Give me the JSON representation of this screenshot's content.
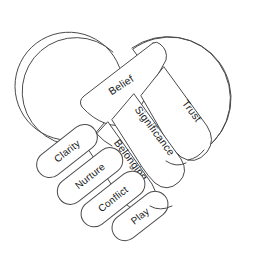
{
  "diagram": {
    "type": "concept-diagram",
    "background_color": "#ffffff",
    "stroke_color": "#4a4a4a",
    "text_color": "#1b1b1b",
    "fill_color": "#ffffff",
    "hands": [
      {
        "name": "left-hand-palm",
        "shape": "circle",
        "cx": 68,
        "cy": 82,
        "r": 54
      },
      {
        "name": "right-hand-palm",
        "shape": "circle",
        "cx": 177,
        "cy": 80,
        "r": 56
      }
    ],
    "fingers": [
      {
        "id": "belief",
        "label": "Belief",
        "rotation": -32,
        "x": 120,
        "y": 84,
        "group": "upper-finger"
      },
      {
        "id": "trust",
        "label": "Trust",
        "rotation": 52,
        "x": 192,
        "y": 108,
        "group": "upper-finger"
      },
      {
        "id": "significance",
        "label": "Significance",
        "rotation": 52,
        "x": 160,
        "y": 128,
        "group": "upper-finger"
      },
      {
        "id": "belonging",
        "label": "Belonging",
        "rotation": 52,
        "x": 137,
        "y": 156,
        "group": "upper-finger"
      }
    ],
    "capsules": [
      {
        "id": "clarity",
        "label": "Clarity",
        "rotation": -38,
        "x": 67,
        "y": 151,
        "group": "lower-finger"
      },
      {
        "id": "nurture",
        "label": "Nurture",
        "rotation": -38,
        "x": 90,
        "y": 176,
        "group": "lower-finger"
      },
      {
        "id": "conflict",
        "label": "Conflict",
        "rotation": -38,
        "x": 113,
        "y": 199,
        "group": "lower-finger"
      },
      {
        "id": "play",
        "label": "Play",
        "rotation": -38,
        "x": 138,
        "y": 218,
        "group": "lower-finger"
      }
    ],
    "all_labels": [
      "Belief",
      "Trust",
      "Significance",
      "Belonging",
      "Clarity",
      "Nurture",
      "Conflict",
      "Play"
    ]
  }
}
